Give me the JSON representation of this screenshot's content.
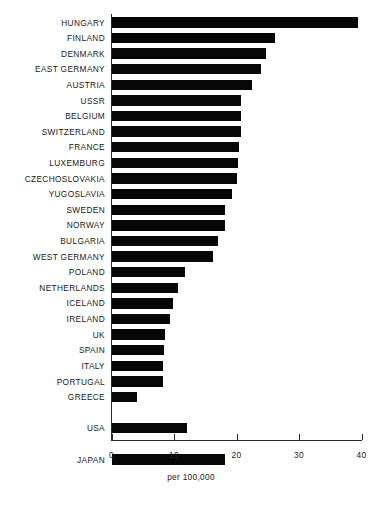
{
  "chart_data": {
    "type": "bar",
    "orientation": "horizontal",
    "title": "",
    "xlabel": "per 100,000",
    "ylabel": "",
    "xlim": [
      0,
      40
    ],
    "xticks": [
      0,
      10,
      20,
      30,
      40
    ],
    "grid": false,
    "legend": null,
    "bar_color": "#070707",
    "categories": [
      "HUNGARY",
      "FINLAND",
      "DENMARK",
      "EAST GERMANY",
      "AUSTRIA",
      "USSR",
      "BELGIUM",
      "SWITZERLAND",
      "FRANCE",
      "LUXEMBURG",
      "CZECHOSLOVAKIA",
      "YUGOSLAVIA",
      "SWEDEN",
      "NORWAY",
      "BULGARIA",
      "WEST GERMANY",
      "POLAND",
      "NETHERLANDS",
      "ICELAND",
      "IRELAND",
      "UK",
      "SPAIN",
      "ITALY",
      "PORTUGAL",
      "GREECE",
      "USA",
      "JAPAN"
    ],
    "values": [
      39.4,
      26.1,
      24.6,
      23.8,
      22.4,
      20.6,
      20.6,
      20.6,
      20.3,
      20.2,
      20.0,
      19.2,
      18.1,
      18.1,
      17.0,
      16.2,
      11.7,
      10.6,
      9.8,
      9.3,
      8.5,
      8.3,
      8.2,
      8.2,
      4.0,
      12.0,
      18.1
    ],
    "group_breaks_before": [
      "USA",
      "JAPAN"
    ]
  },
  "axis": {
    "x_label": "per 100,000",
    "tick_labels": [
      "0",
      "10",
      "20",
      "30",
      "40"
    ]
  },
  "caption": {
    "text": ""
  }
}
